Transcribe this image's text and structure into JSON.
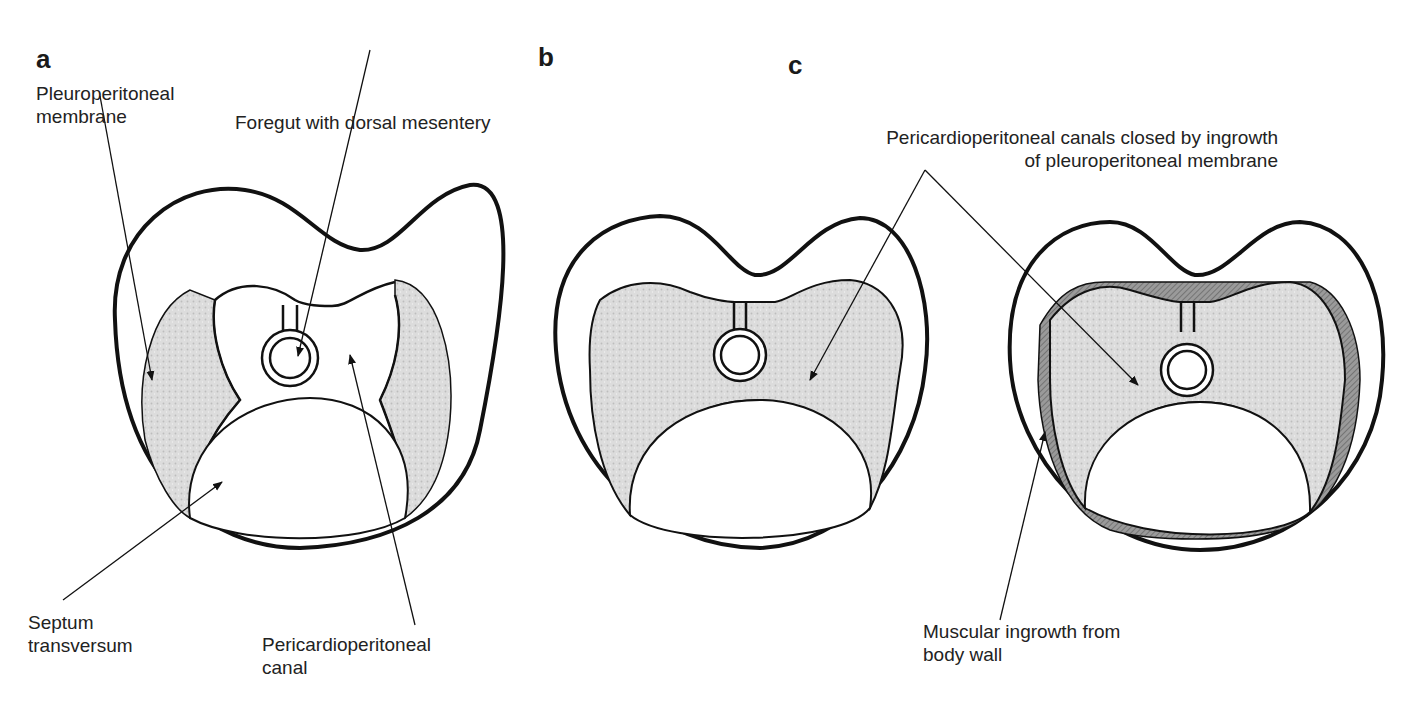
{
  "figure": {
    "panels": [
      {
        "letter": "a",
        "labels": {
          "pleuroperitoneal_membrane": "Pleuroperitoneal\nmembrane",
          "foregut": "Foregut with dorsal mesentery",
          "septum_transversum": "Septum\ntransversum",
          "pericardioperitoneal_canal": "Pericardioperitoneal\ncanal"
        }
      },
      {
        "letter": "b",
        "labels": {}
      },
      {
        "letter": "c",
        "labels": {
          "canals_closed": "Pericardioperitoneal canals closed by ingrowth\nof pleuroperitoneal membrane",
          "muscular_ingrowth": "Muscular ingrowth from\nbody wall"
        }
      }
    ],
    "colors": {
      "outline": "#111111",
      "membrane_fill": "#d9d9d9",
      "muscle_fill": "#8c8c8c",
      "background": "#ffffff"
    }
  }
}
